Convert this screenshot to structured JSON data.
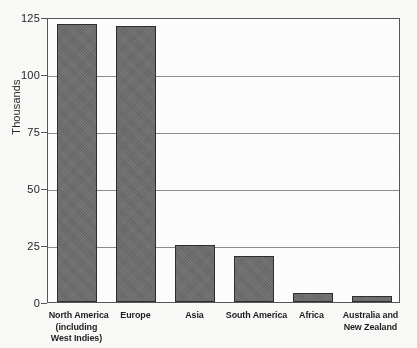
{
  "chart_data": {
    "type": "bar",
    "title": "",
    "subtitle": "",
    "xlabel": "",
    "ylabel": "Thousands",
    "ylim": [
      0,
      125
    ],
    "yticks": [
      0,
      25,
      50,
      75,
      100,
      125
    ],
    "ytick_labels": [
      "0",
      "25",
      "50",
      "75",
      "100",
      "125"
    ],
    "grid": true,
    "legend": false,
    "legend_position": "none",
    "categories": [
      "North America (including West Indies)",
      "Europe",
      "Asia",
      "South America",
      "Africa",
      "Australia and New Zealand"
    ],
    "category_label_lines": [
      [
        "North America",
        "(including",
        "West Indies)"
      ],
      [
        "Europe"
      ],
      [
        "Asia"
      ],
      [
        "South America"
      ],
      [
        "Africa"
      ],
      [
        "Australia and",
        "New Zealand"
      ]
    ],
    "values": [
      122,
      121,
      25,
      20,
      4,
      2.5
    ],
    "units": "Thousands",
    "bar_color": "#6e6e70",
    "bar_edge_color": "#2e2e30",
    "grid_color": "#8d8d90",
    "axis_color": "#58585a",
    "background_color": "#fbfbf9",
    "plot_background_color": "#ffffff"
  }
}
